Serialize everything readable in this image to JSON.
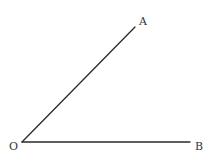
{
  "diagram": {
    "type": "angle",
    "vertex": {
      "label": "O",
      "x": 22,
      "y": 142,
      "label_x": 9,
      "label_y": 150
    },
    "points": [
      {
        "label": "A",
        "x": 135,
        "y": 27,
        "label_x": 139,
        "label_y": 25
      },
      {
        "label": "B",
        "x": 190,
        "y": 142,
        "label_x": 195,
        "label_y": 150
      }
    ],
    "rays": [
      {
        "from": "O",
        "to": "A"
      },
      {
        "from": "O",
        "to": "B"
      }
    ],
    "colors": {
      "line": "#2a2a2a",
      "label": "#333333",
      "background": "#ffffff"
    }
  }
}
